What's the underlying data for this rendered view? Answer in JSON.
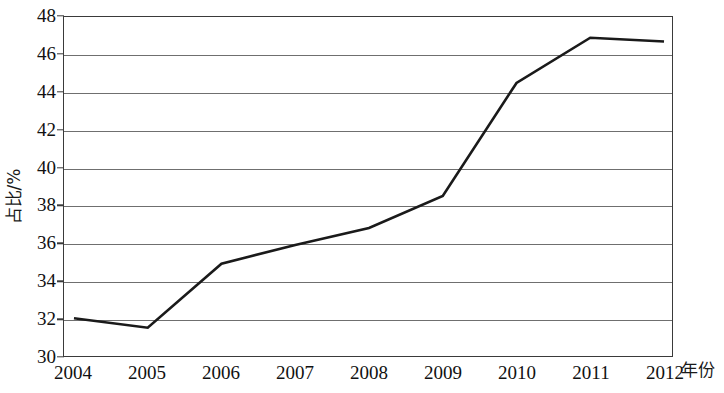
{
  "chart_data": {
    "type": "line",
    "title": "",
    "subtitle": "",
    "xlabel": "年份",
    "ylabel": "占比/%",
    "x": [
      2004,
      2005,
      2006,
      2007,
      2008,
      2009,
      2010,
      2011,
      2012
    ],
    "categories": [
      "2004",
      "2005",
      "2006",
      "2007",
      "2008",
      "2009",
      "2010",
      "2011",
      "2012"
    ],
    "values": [
      32.0,
      31.5,
      34.9,
      35.9,
      36.8,
      38.5,
      44.5,
      46.9,
      46.7
    ],
    "series": [
      {
        "name": "占比/%",
        "values": [
          32.0,
          31.5,
          34.9,
          35.9,
          36.8,
          38.5,
          44.5,
          46.9,
          46.7
        ]
      }
    ],
    "ylim": [
      30,
      48
    ],
    "xlim": [
      2004,
      2012
    ],
    "ytick_labels": [
      "48",
      "46",
      "44",
      "42",
      "40",
      "38",
      "36",
      "34",
      "32",
      "30"
    ],
    "ytick_values": [
      48,
      46,
      44,
      42,
      40,
      38,
      36,
      34,
      32,
      30
    ],
    "xtick_labels": [
      "2004",
      "2005",
      "2006",
      "2007",
      "2008",
      "2009",
      "2010",
      "2011",
      "2012"
    ],
    "grid": "horizontal",
    "legend": "none",
    "line_color": "#1a1a1a",
    "grid_color": "#6f6f6f",
    "axis_color": "#3a3a3a",
    "markers": "none",
    "annotations": []
  }
}
